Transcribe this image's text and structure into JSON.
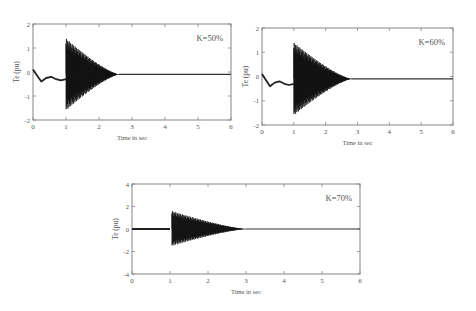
{
  "chart_data": [
    {
      "type": "line",
      "title": "",
      "annotation": "K=50%",
      "xlabel": "Time in sec",
      "ylabel": "Te (pu)",
      "xlim": [
        0,
        6
      ],
      "ylim": [
        -2,
        2
      ],
      "xticks": [
        0,
        1,
        2,
        3,
        4,
        5,
        6
      ],
      "yticks": [
        2,
        1,
        0,
        -1,
        -2
      ],
      "ytick_labels": [
        "2",
        "1",
        "0",
        "-1",
        "-2"
      ],
      "grid": false,
      "series": [
        {
          "name": "Te",
          "pre_fault": [
            [
              0,
              0.1
            ],
            [
              0.1,
              -0.1
            ],
            [
              0.25,
              -0.4
            ],
            [
              0.4,
              -0.25
            ],
            [
              0.55,
              -0.2
            ],
            [
              0.7,
              -0.3
            ],
            [
              0.85,
              -0.35
            ],
            [
              1.0,
              -0.3
            ]
          ],
          "oscillation_start": 1.0,
          "oscillation_peak_max": 1.4,
          "oscillation_peak_min": -1.6,
          "oscillation_end": 2.6,
          "steady_state": -0.1
        }
      ],
      "box_px": {
        "left": 33,
        "top": 24,
        "right": 231,
        "bottom": 120
      }
    },
    {
      "type": "line",
      "title": "",
      "annotation": "K=60%",
      "xlabel": "Time in sec",
      "ylabel": "Te (pu)",
      "xlim": [
        0,
        6
      ],
      "ylim": [
        -2,
        2
      ],
      "xticks": [
        0,
        1,
        2,
        3,
        4,
        5,
        6
      ],
      "yticks": [
        2,
        1,
        0,
        -1,
        -2
      ],
      "ytick_labels": [
        "2",
        "1",
        "0",
        "-1",
        "-2"
      ],
      "grid": false,
      "series": [
        {
          "name": "Te",
          "pre_fault": [
            [
              0,
              0.1
            ],
            [
              0.1,
              -0.1
            ],
            [
              0.25,
              -0.4
            ],
            [
              0.4,
              -0.25
            ],
            [
              0.55,
              -0.2
            ],
            [
              0.7,
              -0.3
            ],
            [
              0.85,
              -0.35
            ],
            [
              1.0,
              -0.3
            ]
          ],
          "oscillation_start": 1.0,
          "oscillation_peak_max": 1.4,
          "oscillation_peak_min": -1.6,
          "oscillation_end": 2.8,
          "steady_state": -0.1
        }
      ],
      "box_px": {
        "left": 262,
        "top": 28,
        "right": 453,
        "bottom": 125
      }
    },
    {
      "type": "line",
      "title": "",
      "annotation": "K=70%",
      "xlabel": "Time in sec",
      "ylabel": "Te (pu)",
      "xlim": [
        0,
        6
      ],
      "ylim": [
        -4,
        4
      ],
      "xticks": [
        0,
        1,
        2,
        3,
        4,
        5,
        6
      ],
      "yticks": [
        4,
        2,
        0,
        -2,
        -4
      ],
      "ytick_labels": [
        "4",
        "2",
        "0",
        "-2",
        "-4"
      ],
      "grid": false,
      "series": [
        {
          "name": "Te",
          "pre_fault": [
            [
              0,
              0
            ],
            [
              1.0,
              0
            ]
          ],
          "oscillation_start": 1.05,
          "oscillation_peak_max": 1.6,
          "oscillation_peak_min": -1.5,
          "oscillation_end": 3.0,
          "steady_state": 0.0
        }
      ],
      "box_px": {
        "left": 132,
        "top": 184,
        "right": 360,
        "bottom": 274
      }
    }
  ]
}
